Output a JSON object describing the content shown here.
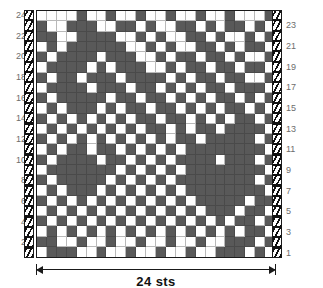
{
  "chart_data": {
    "type": "heatmap",
    "title": "",
    "xlabel": "24 sts",
    "ylabel": "",
    "grid": true,
    "legend_position": "none",
    "stitch_count": 24,
    "row_count": 24,
    "colors": {
      "filled": "#595959",
      "empty": "#ffffff",
      "gridline": "#b9b9b9",
      "border": "#1a1a1a",
      "rownum": "#6d6d6d"
    },
    "x": [
      1,
      2,
      3,
      4,
      5,
      6,
      7,
      8,
      9,
      10,
      11,
      12,
      13,
      14,
      15,
      16,
      17,
      18,
      19,
      20,
      21,
      22,
      23,
      24
    ],
    "row_labels_left": [
      24,
      22,
      20,
      18,
      16,
      14,
      12,
      10,
      8,
      6,
      4,
      2
    ],
    "row_labels_right": [
      23,
      21,
      19,
      17,
      15,
      13,
      11,
      9,
      7,
      5,
      3,
      1
    ],
    "cells": [
      {
        "row": 24,
        "values": [
          0,
          0,
          0,
          0,
          1,
          0,
          0,
          1,
          0,
          0,
          1,
          0,
          0,
          1,
          0,
          0,
          1,
          0,
          0,
          1,
          0,
          0,
          0,
          1
        ]
      },
      {
        "row": 23,
        "values": [
          1,
          0,
          0,
          1,
          1,
          1,
          0,
          0,
          1,
          1,
          0,
          1,
          0,
          0,
          1,
          1,
          0,
          1,
          0,
          1,
          1,
          0,
          1,
          0
        ]
      },
      {
        "row": 22,
        "values": [
          1,
          1,
          0,
          0,
          1,
          1,
          1,
          1,
          0,
          0,
          1,
          0,
          1,
          0,
          0,
          1,
          1,
          0,
          1,
          0,
          0,
          1,
          0,
          1
        ]
      },
      {
        "row": 21,
        "values": [
          0,
          1,
          0,
          1,
          1,
          1,
          1,
          1,
          1,
          0,
          0,
          1,
          0,
          1,
          0,
          0,
          1,
          1,
          0,
          1,
          0,
          1,
          1,
          0
        ]
      },
      {
        "row": 20,
        "values": [
          1,
          0,
          1,
          1,
          1,
          1,
          0,
          1,
          1,
          1,
          0,
          0,
          1,
          0,
          1,
          1,
          0,
          1,
          1,
          0,
          1,
          0,
          0,
          1
        ]
      },
      {
        "row": 19,
        "values": [
          0,
          1,
          1,
          1,
          1,
          0,
          1,
          0,
          1,
          1,
          1,
          0,
          0,
          1,
          0,
          1,
          1,
          0,
          1,
          1,
          0,
          1,
          1,
          0
        ]
      },
      {
        "row": 18,
        "values": [
          1,
          0,
          1,
          1,
          0,
          1,
          1,
          1,
          0,
          1,
          1,
          1,
          1,
          0,
          1,
          0,
          1,
          1,
          0,
          1,
          1,
          0,
          0,
          1
        ]
      },
      {
        "row": 17,
        "values": [
          0,
          1,
          1,
          1,
          1,
          0,
          1,
          1,
          1,
          0,
          1,
          1,
          0,
          1,
          0,
          1,
          0,
          1,
          1,
          0,
          1,
          1,
          1,
          0
        ]
      },
      {
        "row": 16,
        "values": [
          1,
          0,
          1,
          1,
          1,
          1,
          1,
          0,
          1,
          1,
          0,
          1,
          1,
          0,
          1,
          0,
          1,
          0,
          1,
          1,
          0,
          1,
          0,
          1
        ]
      },
      {
        "row": 15,
        "values": [
          0,
          1,
          0,
          1,
          1,
          1,
          0,
          1,
          0,
          1,
          1,
          0,
          1,
          1,
          0,
          1,
          0,
          1,
          0,
          1,
          1,
          0,
          1,
          0
        ]
      },
      {
        "row": 14,
        "values": [
          1,
          0,
          1,
          0,
          1,
          0,
          1,
          0,
          1,
          0,
          1,
          1,
          0,
          1,
          1,
          0,
          1,
          0,
          1,
          0,
          1,
          1,
          0,
          1
        ]
      },
      {
        "row": 13,
        "values": [
          0,
          1,
          0,
          1,
          0,
          1,
          0,
          1,
          0,
          1,
          0,
          1,
          1,
          0,
          1,
          0,
          1,
          1,
          0,
          1,
          1,
          1,
          1,
          0
        ]
      },
      {
        "row": 12,
        "values": [
          1,
          0,
          1,
          0,
          1,
          0,
          1,
          0,
          1,
          0,
          1,
          0,
          1,
          0,
          1,
          1,
          0,
          1,
          1,
          1,
          1,
          1,
          0,
          1
        ]
      },
      {
        "row": 11,
        "values": [
          0,
          1,
          0,
          1,
          1,
          0,
          1,
          1,
          0,
          1,
          0,
          1,
          0,
          1,
          0,
          1,
          1,
          1,
          1,
          1,
          1,
          1,
          1,
          0
        ]
      },
      {
        "row": 10,
        "values": [
          1,
          0,
          1,
          1,
          1,
          1,
          0,
          1,
          1,
          0,
          1,
          0,
          1,
          0,
          1,
          1,
          1,
          1,
          0,
          1,
          1,
          1,
          0,
          1
        ]
      },
      {
        "row": 9,
        "values": [
          0,
          1,
          1,
          1,
          1,
          1,
          1,
          1,
          0,
          1,
          0,
          1,
          0,
          1,
          0,
          1,
          1,
          1,
          1,
          1,
          1,
          1,
          1,
          0
        ]
      },
      {
        "row": 8,
        "values": [
          1,
          0,
          1,
          1,
          1,
          1,
          1,
          0,
          1,
          0,
          1,
          0,
          1,
          0,
          1,
          1,
          1,
          1,
          1,
          1,
          1,
          1,
          0,
          1
        ]
      },
      {
        "row": 7,
        "values": [
          0,
          1,
          0,
          1,
          1,
          1,
          0,
          1,
          0,
          1,
          0,
          1,
          0,
          1,
          0,
          1,
          1,
          1,
          1,
          1,
          1,
          1,
          1,
          0
        ]
      },
      {
        "row": 6,
        "values": [
          1,
          0,
          1,
          0,
          1,
          0,
          1,
          0,
          1,
          0,
          1,
          0,
          1,
          0,
          1,
          0,
          1,
          1,
          1,
          1,
          1,
          0,
          1,
          1
        ]
      },
      {
        "row": 5,
        "values": [
          0,
          1,
          0,
          1,
          0,
          1,
          0,
          1,
          0,
          1,
          0,
          1,
          0,
          1,
          0,
          1,
          0,
          1,
          1,
          1,
          0,
          1,
          1,
          0
        ]
      },
      {
        "row": 4,
        "values": [
          1,
          0,
          1,
          0,
          1,
          0,
          1,
          0,
          1,
          0,
          1,
          0,
          1,
          0,
          1,
          0,
          1,
          0,
          1,
          0,
          1,
          1,
          0,
          1
        ]
      },
      {
        "row": 3,
        "values": [
          0,
          1,
          0,
          1,
          0,
          1,
          0,
          1,
          0,
          1,
          0,
          1,
          0,
          1,
          0,
          1,
          0,
          1,
          0,
          1,
          0,
          1,
          1,
          0
        ]
      },
      {
        "row": 2,
        "values": [
          1,
          1,
          0,
          0,
          1,
          0,
          0,
          1,
          0,
          0,
          1,
          0,
          0,
          1,
          0,
          0,
          1,
          0,
          0,
          1,
          1,
          1,
          0,
          1
        ]
      },
      {
        "row": 1,
        "values": [
          0,
          1,
          1,
          1,
          0,
          0,
          1,
          0,
          0,
          1,
          0,
          0,
          1,
          0,
          0,
          1,
          0,
          0,
          1,
          1,
          1,
          0,
          1,
          0
        ]
      }
    ]
  },
  "chart": {
    "width_label": "24 sts"
  },
  "selvage": {
    "left_name": "selvage-left",
    "right_name": "selvage-right"
  }
}
